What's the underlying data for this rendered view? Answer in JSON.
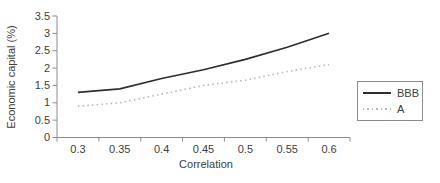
{
  "figure": {
    "background": "#ffffff"
  },
  "chart_data": {
    "type": "line",
    "categories": [
      "0.3",
      "0.35",
      "0.4",
      "0.45",
      "0.5",
      "0.55",
      "0.6"
    ],
    "series": [
      {
        "name": "BBB",
        "values": [
          1.3,
          1.4,
          1.7,
          1.95,
          2.25,
          2.6,
          3.0
        ],
        "line_style": "solid",
        "color": "#2e2e2e"
      },
      {
        "name": "A",
        "values": [
          0.9,
          1.0,
          1.25,
          1.5,
          1.65,
          1.9,
          2.1
        ],
        "line_style": "dotted",
        "color": "#b8b8b8"
      }
    ],
    "title": "",
    "xlabel": "Correlation",
    "ylabel": "Economic capital (%)",
    "ylim": [
      0,
      3.5
    ],
    "y_ticks": [
      "0",
      "0.5",
      "1",
      "1.5",
      "2",
      "2.5",
      "3",
      "3.5"
    ],
    "grid": false,
    "legend_position": "right",
    "axis_color": "#8c8c8c",
    "text_color": "#3d3d3d"
  }
}
